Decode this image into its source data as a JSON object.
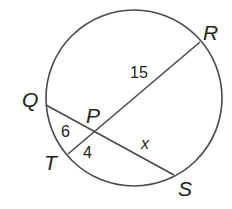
{
  "diagram": {
    "type": "circle with two intersecting chords",
    "colors": {
      "stroke": "#4a4a4a",
      "text": "#231f20",
      "background": "#ffffff"
    },
    "circle": {
      "cx": 134,
      "cy": 98,
      "r": 88
    },
    "points": {
      "Q": {
        "label": "Q",
        "x": 46,
        "y": 105
      },
      "R": {
        "label": "R",
        "x": 200,
        "y": 42
      },
      "S": {
        "label": "S",
        "x": 174,
        "y": 175
      },
      "T": {
        "label": "T",
        "x": 68,
        "y": 154
      },
      "P": {
        "label": "P",
        "x": 95,
        "y": 131
      }
    },
    "chords": [
      {
        "name": "QS",
        "from": "Q",
        "to": "S"
      },
      {
        "name": "TR",
        "from": "T",
        "to": "R"
      }
    ],
    "segments": {
      "PR": "15",
      "QP": "6",
      "TP": "4",
      "PS": "x"
    }
  }
}
